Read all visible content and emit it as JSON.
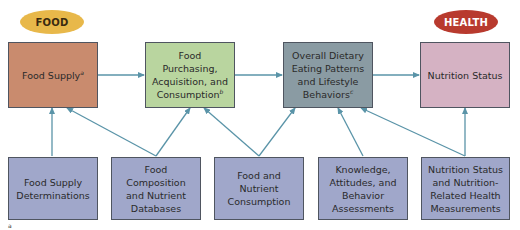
{
  "labels": {
    "food": "FOOD",
    "health": "HEALTH"
  },
  "colors": {
    "food_label": "#E8B84A",
    "health_label": "#B83A2E",
    "food_supply": "#C98B6E",
    "food_purchasing": "#B9D59F",
    "overall_dietary": "#8A9BA3",
    "nutrition_status": "#D5B2C3",
    "measurement_boxes": "#A0A7CA",
    "arrow": "#5A94A8"
  },
  "top_row": [
    {
      "id": "food-supply",
      "text": "Food Supply",
      "sup": "a"
    },
    {
      "id": "food-purchasing",
      "text": "Food Purchasing, Acquisition, and Consumption",
      "sup": "b"
    },
    {
      "id": "overall-dietary",
      "text": "Overall Dietary Eating Patterns and Lifestyle Behaviors",
      "sup": "c"
    },
    {
      "id": "nutrition-status",
      "text": "Nutrition Status",
      "sup": ""
    }
  ],
  "bottom_row": [
    {
      "id": "food-supply-determinations",
      "text": "Food Supply Determinations"
    },
    {
      "id": "food-composition",
      "text": "Food Composition and Nutrient Databases"
    },
    {
      "id": "food-nutrient-consumption",
      "text": "Food and Nutrient Consumption"
    },
    {
      "id": "knowledge-attitudes",
      "text": "Knowledge, Attitudes, and Behavior Assessments"
    },
    {
      "id": "nutrition-health-measurements",
      "text": "Nutrition Status and Nutrition-Related Health Measurements"
    }
  ],
  "footnote": "a"
}
